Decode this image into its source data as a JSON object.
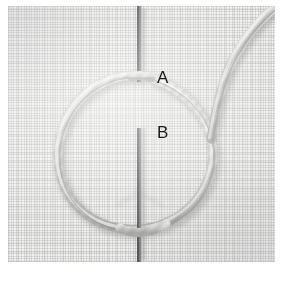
{
  "figure": {
    "kind": "photograph",
    "plate": {
      "x": 8,
      "y": 6,
      "width": 267,
      "height": 256,
      "background_color": "#f2f2f0",
      "fabric_color": "#f3f3f1",
      "weave_color": "#969698"
    },
    "labels": [
      {
        "id": "A",
        "text": "A",
        "x": 149,
        "y": 63,
        "color": "#191919",
        "meaning": "upper point where needle enters the fabric inside the loop"
      },
      {
        "id": "B",
        "text": "B",
        "x": 149,
        "y": 118,
        "color": "#191919",
        "meaning": "lower point where needle emerges from the fabric inside the loop"
      }
    ],
    "needle": {
      "name": "sewing-needle",
      "orientation": "vertical",
      "x": 131,
      "color": "#3a3a3c",
      "highlight_color": "#8e8e90",
      "width_px": 4,
      "segments": [
        {
          "from_y": 2,
          "to_y": 74,
          "note": "above-fabric upper shaft"
        },
        {
          "from_y": 122,
          "to_y": 254,
          "note": "below-point lower shaft"
        }
      ],
      "hidden_span": {
        "from_y": 74,
        "to_y": 122,
        "note": "needle passes under the fabric between A and B"
      }
    },
    "thread": {
      "name": "twisted-embroidery-thread",
      "color": "#c9c9c7",
      "shadow_color": "#9a9a98",
      "twist_color": "#8c8c8a",
      "width_px": 8,
      "parts": [
        {
          "id": "loop",
          "shape": "open-circle",
          "center_x": 126,
          "center_y": 148,
          "radius_x": 78,
          "radius_y": 76,
          "note": "loop of thread laid on the fabric, opening at the top near A"
        },
        {
          "id": "tail",
          "shape": "curve-to-upper-right",
          "note": "working thread sweeps from the loop's right side up to the top-right corner"
        }
      ]
    },
    "caption": {
      "text": "",
      "note": "bottom caption line is cropped off by the screenshot edge"
    }
  }
}
